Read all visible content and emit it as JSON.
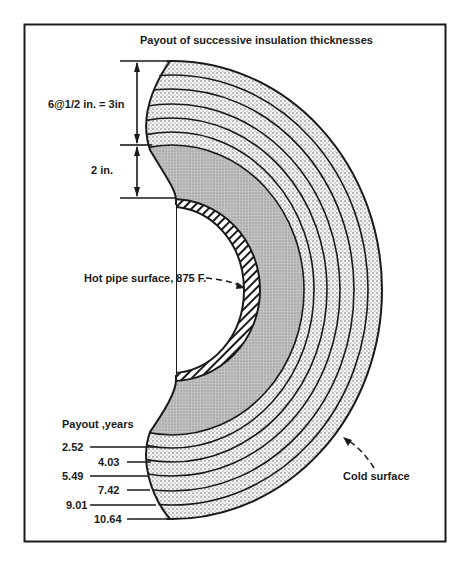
{
  "figure": {
    "title": "Payout of successive insulation thicknesses",
    "dimensions": {
      "layers_label": "6@1/2 in. = 3in",
      "base_label": "2 in."
    },
    "annotations": {
      "hot_surface": "Hot pipe surface, 875 F.",
      "cold_surface": "Cold surface"
    },
    "payout": {
      "heading": "Payout ,years",
      "values": [
        "2.52",
        "4.03",
        "5.49",
        "7.42",
        "9.01",
        "10.64"
      ]
    },
    "colors": {
      "ink": "#1a1a1a",
      "base_insulation": "#c8c8c8",
      "added_layers": "#ececec",
      "background": "#ffffff"
    }
  }
}
